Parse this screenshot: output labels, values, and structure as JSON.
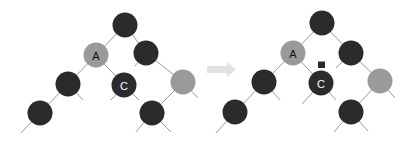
{
  "colors": {
    "black_node": "#2b2b2b",
    "red_node": "#9a9a9a",
    "edge": "#9a9a9a",
    "arrow": "#e2e2e2",
    "marker": "#2b2b2b",
    "label_on_gray": "#111111",
    "label_on_black": "#ffffff"
  },
  "before": {
    "labels": {
      "A": "A",
      "C": "C"
    }
  },
  "arrow": {
    "icon": "right-arrow-icon"
  },
  "after": {
    "labels": {
      "A": "A",
      "C": "C"
    },
    "marker": "black-square-marker"
  }
}
